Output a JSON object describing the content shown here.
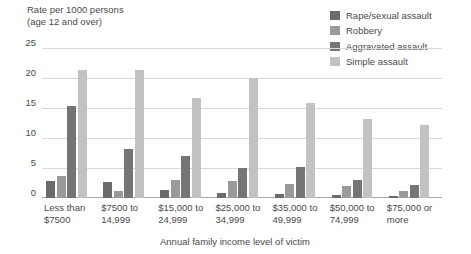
{
  "chart_data": {
    "type": "bar",
    "title": "",
    "ylabel": "Rate per 1000 persons\n(age 12 and over)",
    "xlabel": "Annual family income level of victim",
    "ylim": [
      0,
      25
    ],
    "yticks": [
      25,
      20,
      15,
      10,
      5,
      0
    ],
    "grid": true,
    "legend_position": "top-right",
    "categories": [
      "Less than\n$7500",
      "$7500 to\n14,999",
      "$15,000 to\n24,999",
      "$25,000 to\n34,999",
      "$35,000 to\n49,999",
      "$50,000 to\n74,999",
      "$75,000 or\nmore"
    ],
    "series": [
      {
        "name": "Rape/sexual assault",
        "color": "#6b6b6b",
        "values": [
          2.8,
          2.6,
          1.3,
          0.8,
          0.7,
          0.5,
          0.4
        ]
      },
      {
        "name": "Robbery",
        "color": "#9a9a9a",
        "values": [
          3.6,
          1.1,
          3.0,
          2.8,
          2.3,
          2.0,
          1.2
        ]
      },
      {
        "name": "Aggravated assault",
        "color": "#757575",
        "values": [
          15.3,
          8.2,
          7.0,
          5.0,
          5.2,
          3.0,
          2.2
        ]
      },
      {
        "name": "Simple assault",
        "color": "#c2c2c2",
        "values": [
          21.3,
          21.4,
          16.7,
          20.0,
          15.8,
          13.2,
          12.2
        ]
      }
    ]
  },
  "colors": {
    "grid": "#d8d8d8",
    "axis": "#a8a8a8",
    "text": "#4a4a4a",
    "background": "#ffffff"
  }
}
